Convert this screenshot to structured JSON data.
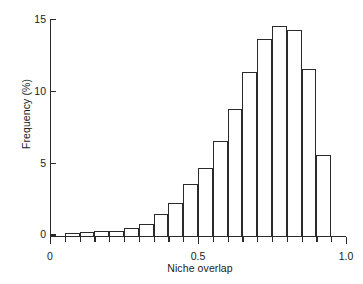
{
  "chart_data": {
    "type": "bar",
    "title": "",
    "xlabel": "Niche overlap",
    "ylabel": "Frequency (%)",
    "xlim": [
      0,
      1.0
    ],
    "ylim": [
      0,
      15
    ],
    "grid": false,
    "legend": null,
    "bin_width": 0.05,
    "x_tick_labels": [
      "0",
      "0.5",
      "1.0"
    ],
    "x_tick_values": [
      0,
      0.5,
      1.0
    ],
    "x_minor_tick_values": [
      0.05,
      0.1,
      0.15,
      0.2,
      0.25,
      0.3,
      0.35,
      0.4,
      0.45,
      0.55,
      0.6,
      0.65,
      0.7,
      0.75,
      0.8,
      0.85,
      0.9,
      0.95
    ],
    "y_tick_labels": [
      "0",
      "5",
      "10",
      "15"
    ],
    "y_tick_values": [
      0,
      5,
      10,
      15
    ],
    "bin_starts": [
      0.05,
      0.1,
      0.15,
      0.2,
      0.25,
      0.3,
      0.35,
      0.4,
      0.45,
      0.5,
      0.55,
      0.6,
      0.65,
      0.7,
      0.75,
      0.8,
      0.85,
      0.9
    ],
    "bin_ends": [
      0.1,
      0.15,
      0.2,
      0.25,
      0.3,
      0.35,
      0.4,
      0.45,
      0.5,
      0.55,
      0.6,
      0.65,
      0.7,
      0.75,
      0.8,
      0.85,
      0.9,
      0.95
    ],
    "categories": [
      "0.05-0.10",
      "0.10-0.15",
      "0.15-0.20",
      "0.20-0.25",
      "0.25-0.30",
      "0.30-0.35",
      "0.35-0.40",
      "0.40-0.45",
      "0.45-0.50",
      "0.50-0.55",
      "0.55-0.60",
      "0.60-0.65",
      "0.65-0.70",
      "0.70-0.75",
      "0.75-0.80",
      "0.80-0.85",
      "0.85-0.90",
      "0.90-0.95"
    ],
    "values": [
      0.2,
      0.25,
      0.3,
      0.35,
      0.5,
      0.8,
      1.5,
      2.3,
      3.6,
      4.7,
      6.6,
      8.8,
      11.4,
      13.7,
      14.6,
      14.3,
      11.6,
      5.6
    ]
  }
}
